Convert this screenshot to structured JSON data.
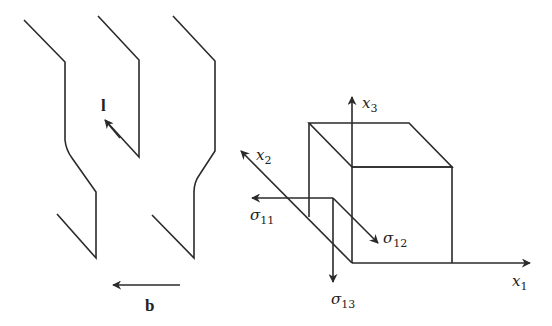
{
  "left_figure": {
    "description": "Dislocation line segments with line direction and Burgers vector",
    "line_direction_label": "l",
    "burgers_vector_label": "b"
  },
  "right_figure": {
    "description": "Stress element cube with coordinate axes and stress components",
    "axes": {
      "x1": {
        "symbol": "x",
        "subscript": "1"
      },
      "x2": {
        "symbol": "x",
        "subscript": "2"
      },
      "x3": {
        "symbol": "x",
        "subscript": "3"
      }
    },
    "stresses": {
      "s11": {
        "symbol": "σ",
        "subscript": "11"
      },
      "s12": {
        "symbol": "σ",
        "subscript": "12"
      },
      "s13": {
        "symbol": "σ",
        "subscript": "13"
      }
    }
  },
  "colors": {
    "line": "#2a2a2a",
    "background": "#ffffff"
  }
}
